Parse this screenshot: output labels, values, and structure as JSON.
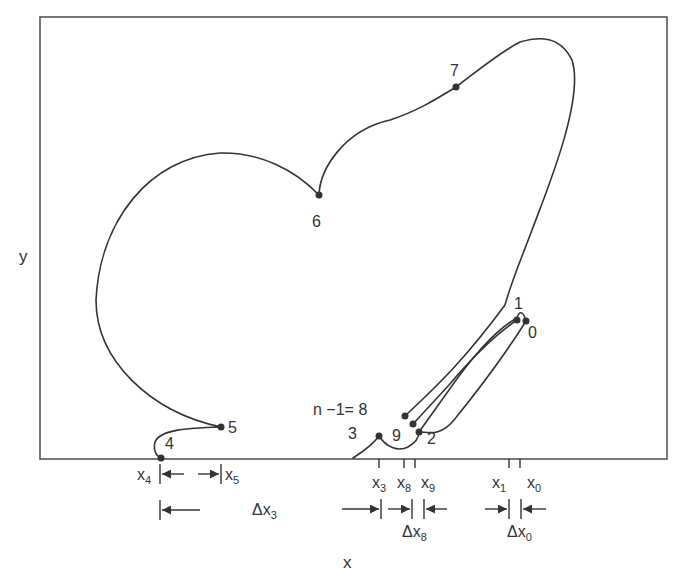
{
  "figure": {
    "type": "diagram",
    "axes": {
      "x_label": "x",
      "y_label": "y"
    },
    "points": [
      {
        "id": "0",
        "label": "0"
      },
      {
        "id": "1",
        "label": "1"
      },
      {
        "id": "2",
        "label": "2"
      },
      {
        "id": "3",
        "label": "3"
      },
      {
        "id": "4",
        "label": "4"
      },
      {
        "id": "5",
        "label": "5"
      },
      {
        "id": "6",
        "label": "6"
      },
      {
        "id": "7",
        "label": "7"
      },
      {
        "id": "8",
        "label": "n −1= 8"
      },
      {
        "id": "9",
        "label": "9"
      }
    ],
    "x_ticks": {
      "x4": {
        "base": "x",
        "sub": "4"
      },
      "x5": {
        "base": "x",
        "sub": "5"
      },
      "x3": {
        "base": "x",
        "sub": "3"
      },
      "x8": {
        "base": "x",
        "sub": "8"
      },
      "x9": {
        "base": "x",
        "sub": "9"
      },
      "x1": {
        "base": "x",
        "sub": "1"
      },
      "x0": {
        "base": "x",
        "sub": "0"
      }
    },
    "intervals": {
      "dx3": {
        "base": "Δx",
        "sub": "3"
      },
      "dx8": {
        "base": "Δx",
        "sub": "8"
      },
      "dx0": {
        "base": "Δx",
        "sub": "0"
      }
    },
    "colors": {
      "ink": "#333333",
      "frame": "#555555",
      "background": "#ffffff"
    }
  }
}
